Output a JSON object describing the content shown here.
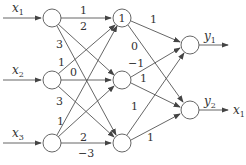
{
  "diagram": {
    "type": "neural-network",
    "inputs": [
      {
        "id": "x1",
        "label": "x",
        "sub": "1"
      },
      {
        "id": "x2",
        "label": "x",
        "sub": "2"
      },
      {
        "id": "x3",
        "label": "x",
        "sub": "3"
      }
    ],
    "hidden_top_label": "1",
    "outputs": [
      {
        "id": "y1",
        "label": "y",
        "sub": "1"
      },
      {
        "id": "y2",
        "label": "y",
        "sub": "2"
      }
    ],
    "output_extra": {
      "label": "x",
      "sub": "1"
    },
    "weights": {
      "in1_h1_a": "1",
      "in1_h1_b": "2",
      "in1_h3": "3",
      "in2_h1": "1",
      "in2_h2": "0",
      "in3_h1": "3",
      "in3_h2": "1",
      "in3_h3_a": "2",
      "in3_h3_b": "−3",
      "h1_o1": "1",
      "h1_o2": "0",
      "h2_o1": "−1",
      "h2_o2": "1",
      "h3_o1": "1",
      "h3_o2": "1"
    }
  }
}
